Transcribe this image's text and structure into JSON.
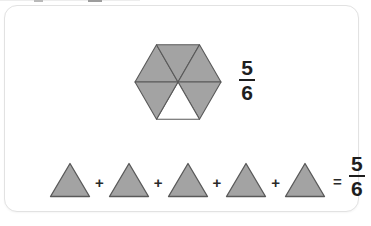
{
  "figure": {
    "title_text": "",
    "background_color": "#ffffff",
    "card": {
      "background_color": "#ffffff",
      "border_color": "#e2e2e2"
    },
    "shape_fill_color": "#a3a3a3",
    "shape_stroke_color": "#595959",
    "unshaded_fill_color": "#ffffff",
    "text_color": "#1e1e1e"
  },
  "hexagon": {
    "name": "hexagon-six-triangles",
    "total_parts": 6,
    "shaded_parts": 5,
    "unshaded_parts": 1,
    "unshaded_position": "bottom-center",
    "fraction": {
      "numerator": "5",
      "denominator": "6"
    }
  },
  "equation": {
    "terms": [
      {
        "shape": "triangle",
        "label": "triangle-1"
      },
      {
        "shape": "triangle",
        "label": "triangle-2"
      },
      {
        "shape": "triangle",
        "label": "triangle-3"
      },
      {
        "shape": "triangle",
        "label": "triangle-4"
      },
      {
        "shape": "triangle",
        "label": "triangle-5"
      }
    ],
    "plus_symbol": "+",
    "equals_symbol": "=",
    "result_fraction": {
      "numerator": "5",
      "denominator": "6"
    }
  }
}
